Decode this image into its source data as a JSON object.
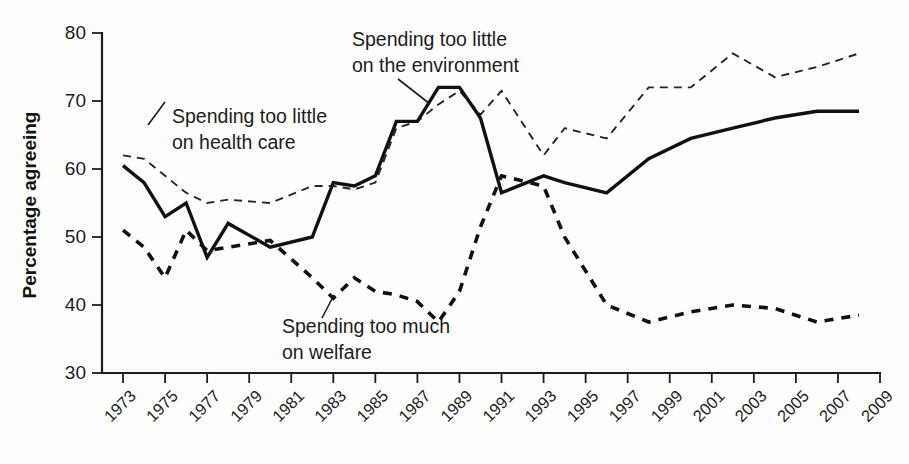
{
  "chart_data": {
    "type": "line",
    "title": "",
    "xlabel": "",
    "ylabel": "Percentage agreeing",
    "ylim": [
      30,
      80
    ],
    "yticks": [
      30,
      40,
      50,
      60,
      70,
      80
    ],
    "xlim": [
      1972,
      2009
    ],
    "xticks": [
      1973,
      1975,
      1977,
      1979,
      1981,
      1983,
      1985,
      1987,
      1989,
      1991,
      1993,
      1995,
      1997,
      1999,
      2001,
      2003,
      2005,
      2007,
      2009
    ],
    "grid": false,
    "legend_position": "inline-annotations",
    "annotations": [
      {
        "id": "environment",
        "text_line1": "Spending too little",
        "text_line2": "on the environment"
      },
      {
        "id": "healthcare",
        "text_line1": "Spending too little",
        "text_line2": "on health care"
      },
      {
        "id": "welfare",
        "text_line1": "Spending too much",
        "text_line2": "on welfare"
      }
    ],
    "series": [
      {
        "name": "Spending too little on the environment",
        "style": "solid-thick",
        "x": [
          1973,
          1974,
          1975,
          1976,
          1977,
          1978,
          1980,
          1982,
          1983,
          1984,
          1985,
          1986,
          1987,
          1988,
          1989,
          1990,
          1991,
          1993,
          1994,
          1996,
          1998,
          2000,
          2002,
          2004,
          2006,
          2008
        ],
        "values": [
          60.5,
          58.0,
          53.0,
          55.0,
          47.0,
          52.0,
          48.5,
          50.0,
          58.0,
          57.5,
          59.0,
          67.0,
          67.0,
          72.0,
          72.0,
          67.5,
          56.5,
          59.0,
          58.0,
          56.5,
          61.5,
          64.5,
          66.0,
          67.5,
          68.5,
          68.5
        ]
      },
      {
        "name": "Spending too little on health care",
        "style": "dashed-thin",
        "x": [
          1973,
          1974,
          1975,
          1976,
          1977,
          1978,
          1980,
          1982,
          1983,
          1984,
          1985,
          1986,
          1987,
          1988,
          1989,
          1990,
          1991,
          1993,
          1994,
          1996,
          1998,
          2000,
          2002,
          2004,
          2006,
          2008
        ],
        "values": [
          62.0,
          61.5,
          59.0,
          56.5,
          55.0,
          55.5,
          55.0,
          57.5,
          57.5,
          57.0,
          58.0,
          66.0,
          67.0,
          69.5,
          71.5,
          68.0,
          71.5,
          62.0,
          66.0,
          64.5,
          72.0,
          72.0,
          77.0,
          73.5,
          75.0,
          77.0
        ]
      },
      {
        "name": "Spending too much on welfare",
        "style": "dashed-thick",
        "x": [
          1973,
          1974,
          1975,
          1976,
          1977,
          1978,
          1980,
          1982,
          1983,
          1984,
          1985,
          1986,
          1987,
          1988,
          1989,
          1990,
          1991,
          1993,
          1994,
          1996,
          1998,
          2000,
          2002,
          2004,
          2006,
          2008
        ],
        "values": [
          51.0,
          48.5,
          44.0,
          51.0,
          48.0,
          48.5,
          49.5,
          44.0,
          41.0,
          44.0,
          42.0,
          41.5,
          40.5,
          37.5,
          42.0,
          51.5,
          59.0,
          57.5,
          50.0,
          40.0,
          37.5,
          39.0,
          40.0,
          39.5,
          37.5,
          38.5
        ]
      }
    ]
  }
}
